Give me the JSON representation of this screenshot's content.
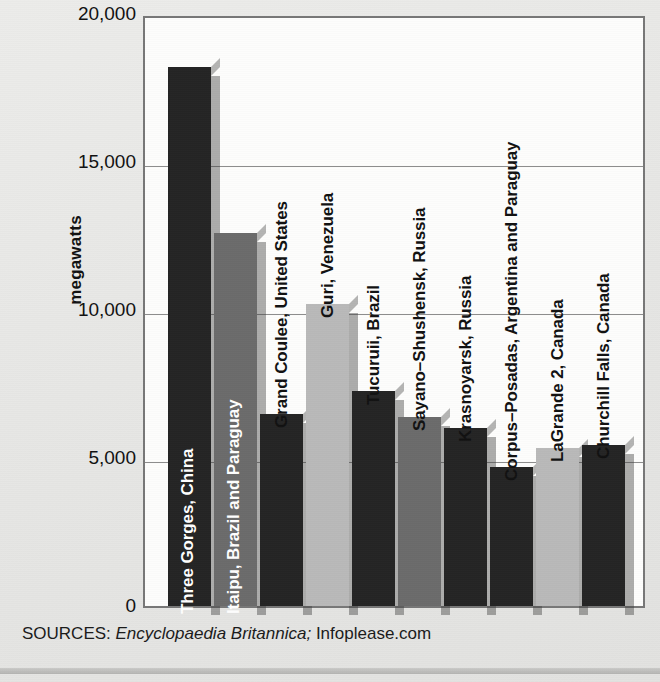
{
  "chart_data": {
    "type": "bar",
    "title": "",
    "xlabel": "",
    "ylabel": "megawatts",
    "ylim": [
      0,
      20000
    ],
    "grid": true,
    "legend": "none",
    "yticks": [
      "20,000",
      "15,000",
      "10,000",
      "5,000",
      "0"
    ],
    "ytick_values": [
      20000,
      15000,
      10000,
      5000,
      0
    ],
    "categories": [
      "Three Gorges, China",
      "Itaipu, Brazil and Paraguay",
      "Grand Coulee, United States",
      "Guri, Venezuela",
      "Tucuruii, Brazil",
      "Sayano–Shushensk, Russia",
      "Krasnoyarsk, Russia",
      "Corpus–Posadas, Argentina and Paraguay",
      "LaGrande 2, Canada",
      "Churchill Falls, Canada"
    ],
    "values": [
      18200,
      12600,
      6480,
      10200,
      7260,
      6400,
      6000,
      4700,
      5330,
      5430
    ],
    "bar_tone": [
      "dark",
      "medium",
      "dark",
      "light",
      "dark",
      "medium",
      "dark",
      "dark",
      "light",
      "dark"
    ],
    "label_placement": [
      "on-bar",
      "on-bar",
      "off-bar",
      "off-bar",
      "off-bar",
      "off-bar",
      "off-bar",
      "off-bar",
      "off-bar",
      "off-bar"
    ]
  },
  "axis": {
    "y_label": "megawatts"
  },
  "source": {
    "prefix": "SOURCES:",
    "italic_part": "Encyclopaedia Britannica;",
    "tail": "Infoplease.com"
  },
  "colors": {
    "dark": "#242424",
    "medium": "#6b6b6b",
    "light": "#b9b9b9",
    "plot_bg": "#fdfdfc",
    "page_bg": "#e9e9e7",
    "gridline": "#8c8c8c",
    "axis_border": "#777777",
    "text": "#111111"
  }
}
